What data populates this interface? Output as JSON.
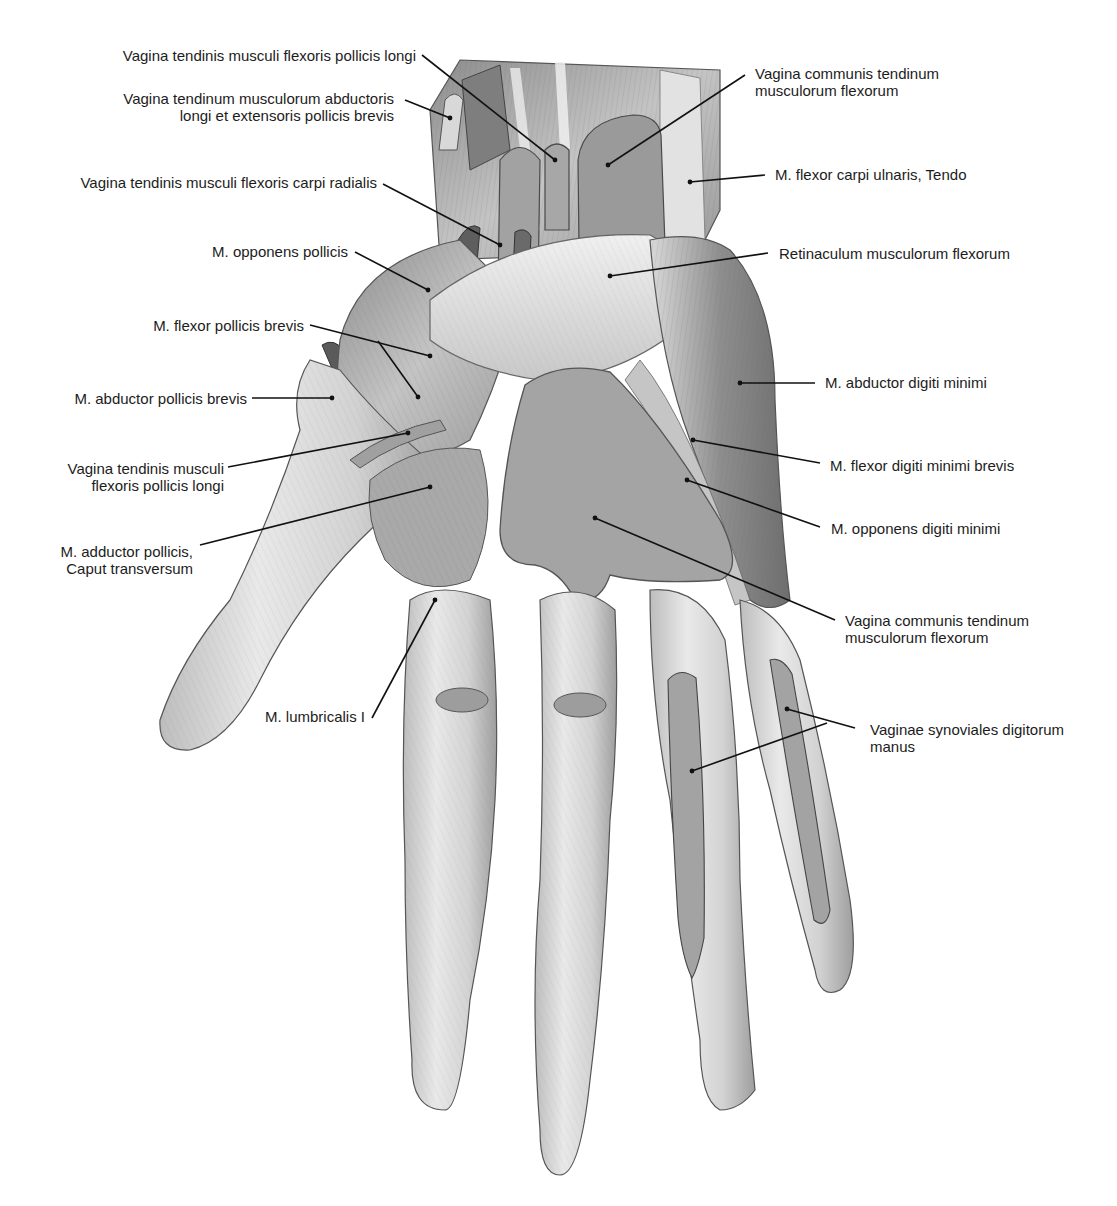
{
  "figure": {
    "colors": {
      "background": "#ffffff",
      "skin_light": "#ececec",
      "muscle_mid": "#bdbdbd",
      "muscle_dark": "#8f8f8f",
      "sheath_fill": "#9a9a9a",
      "outline": "#555555",
      "leader_line": "#111111",
      "text": "#1c1c1c"
    }
  },
  "labels_left": [
    {
      "id": "vag-flex-poll-longi-top",
      "lines": [
        "Vagina tendinis musculi flexoris pollicis longi"
      ]
    },
    {
      "id": "vag-abd-ext-poll",
      "lines": [
        "Vagina tendinum musculorum abductoris",
        "longi et extensoris pollicis brevis"
      ]
    },
    {
      "id": "vag-flex-carpi-rad",
      "lines": [
        "Vagina tendinis musculi flexoris carpi radialis"
      ]
    },
    {
      "id": "m-opponens-pollicis",
      "lines": [
        "M. opponens pollicis"
      ]
    },
    {
      "id": "m-flexor-pollicis-brevis",
      "lines": [
        "M. flexor pollicis brevis"
      ]
    },
    {
      "id": "m-abductor-pollicis-brevis",
      "lines": [
        "M. abductor pollicis brevis"
      ]
    },
    {
      "id": "vag-flex-poll-longi-bottom",
      "lines": [
        "Vagina tendinis musculi",
        "flexoris pollicis longi"
      ]
    },
    {
      "id": "m-adductor-pollicis",
      "lines": [
        "M. adductor pollicis,",
        "Caput transversum"
      ]
    },
    {
      "id": "m-lumbricalis-i",
      "lines": [
        "M. lumbricalis I"
      ]
    }
  ],
  "labels_right": [
    {
      "id": "vag-communis-top",
      "lines": [
        "Vagina communis tendinum",
        "musculorum flexorum"
      ]
    },
    {
      "id": "m-flexor-carpi-ulnaris",
      "lines": [
        "M. flexor carpi ulnaris, Tendo"
      ]
    },
    {
      "id": "retinaculum",
      "lines": [
        "Retinaculum musculorum flexorum"
      ]
    },
    {
      "id": "m-abductor-digiti-minimi",
      "lines": [
        "M. abductor digiti minimi"
      ]
    },
    {
      "id": "m-flexor-digiti-minimi-brevis",
      "lines": [
        "M. flexor digiti minimi brevis"
      ]
    },
    {
      "id": "m-opponens-digiti-minimi",
      "lines": [
        "M. opponens digiti minimi"
      ]
    },
    {
      "id": "vag-communis-bottom",
      "lines": [
        "Vagina communis tendinum",
        "musculorum flexorum"
      ]
    },
    {
      "id": "vaginae-synoviales",
      "lines": [
        "Vaginae synoviales digitorum",
        "manus"
      ]
    }
  ]
}
